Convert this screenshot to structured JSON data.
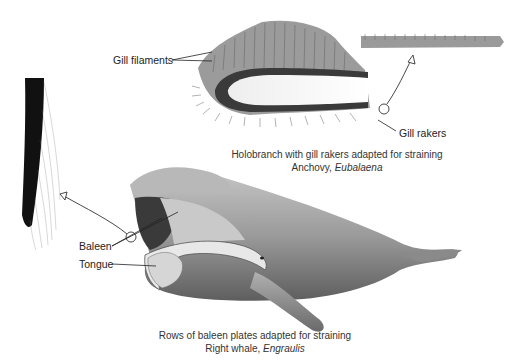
{
  "figure": {
    "gill_panel": {
      "labels": {
        "gill_filaments": "Gill filaments",
        "gill_rakers": "Gill rakers"
      },
      "caption": {
        "line1": "Holobranch with gill rakers adapted for straining",
        "line2_common": "Anchovy, ",
        "line2_genus": "Eubalaena"
      }
    },
    "whale_panel": {
      "labels": {
        "baleen": "Baleen",
        "tongue": "Tongue"
      },
      "caption": {
        "line1": "Rows of baleen plates adapted for straining",
        "line2_common": "Right whale, ",
        "line2_genus": "Engraulis"
      }
    },
    "colors": {
      "ink": "#222222",
      "whale_body": "#9a9a9a",
      "whale_dark": "#5a5a5a",
      "gill": "#707070"
    }
  }
}
